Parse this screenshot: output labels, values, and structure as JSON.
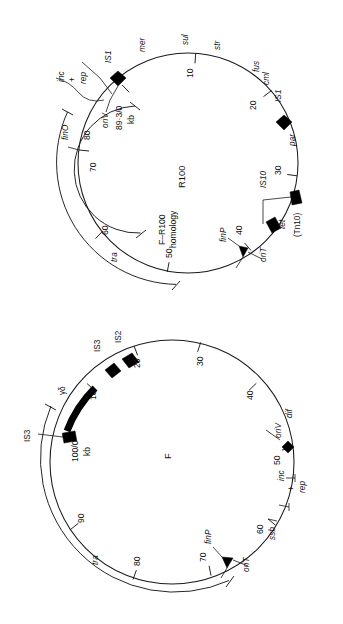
{
  "figure": {
    "background": "#ffffff",
    "ink": "#1a1a1a"
  },
  "maps": [
    {
      "id": "r100",
      "center_label": "R100",
      "origin_label": "89·3/0",
      "unit_label": "kb",
      "inner_arc_label_1": "F–R100",
      "inner_arc_label_2": "homology",
      "tra_label": "tra",
      "scale_ticks": [
        "10",
        "20",
        "30",
        "40",
        "50",
        "60",
        "70",
        "80"
      ],
      "genes": [
        {
          "name": "IS1",
          "type": "element"
        },
        {
          "name": "mer",
          "type": "gene"
        },
        {
          "name": "sul",
          "type": "gene"
        },
        {
          "name": "str",
          "type": "gene"
        },
        {
          "name": "fus",
          "type": "gene"
        },
        {
          "name": "cml",
          "type": "gene"
        },
        {
          "name": "IS1",
          "type": "element"
        },
        {
          "name": "par",
          "type": "gene"
        },
        {
          "name": "IS10",
          "type": "element"
        },
        {
          "name": "tet",
          "type": "gene"
        },
        {
          "name": "(Tn10)",
          "type": "transposon"
        },
        {
          "name": "oriT",
          "type": "site"
        },
        {
          "name": "finP",
          "type": "gene"
        },
        {
          "name": "tra",
          "type": "region"
        },
        {
          "name": "finO",
          "type": "gene"
        },
        {
          "name": "oriV",
          "type": "site"
        },
        {
          "name": "inc",
          "type": "region"
        },
        {
          "name": "rep",
          "type": "region"
        },
        {
          "name": "+",
          "type": "symbol"
        }
      ]
    },
    {
      "id": "f",
      "center_label": "F",
      "origin_label": "100/0",
      "unit_label": "kb",
      "tra_label": "tra",
      "scale_ticks": [
        "10",
        "20",
        "30",
        "40",
        "50",
        "60",
        "70",
        "80",
        "90"
      ],
      "genes": [
        {
          "name": "IS3",
          "type": "element"
        },
        {
          "name": "IS2",
          "type": "element"
        },
        {
          "name": "γδ",
          "type": "transposon"
        },
        {
          "name": "IS3",
          "type": "element"
        },
        {
          "name": "dif",
          "type": "site"
        },
        {
          "name": "oriV",
          "type": "site"
        },
        {
          "name": "inc",
          "type": "region"
        },
        {
          "name": "rep",
          "type": "region"
        },
        {
          "name": "+",
          "type": "symbol"
        },
        {
          "name": "ssb",
          "type": "gene"
        },
        {
          "name": "finP",
          "type": "gene"
        },
        {
          "name": "oriT",
          "type": "site"
        },
        {
          "name": "tra",
          "type": "region"
        }
      ]
    }
  ],
  "r100_labels": {
    "IS1_top": "IS1",
    "mer": "mer",
    "sul": "sul",
    "str": "str",
    "fus": "fus",
    "cml": "cml",
    "IS1_right": "IS1",
    "par": "par",
    "IS10": "IS10",
    "tet": "tet",
    "Tn10": "(Tn10)",
    "oriT": "oriT",
    "finP": "finP",
    "tra": "tra",
    "finO": "finO",
    "oriV": "oriV",
    "inc": "inc",
    "rep": "rep",
    "plus": "+",
    "origin": "89·3/0",
    "kb": "kb",
    "center": "R100",
    "homology1": "F–R100",
    "homology2": "homology",
    "t10": "10",
    "t20": "20",
    "t30": "30",
    "t40": "40",
    "t50": "50",
    "t60": "60",
    "t70": "70",
    "t80": "80"
  },
  "f_labels": {
    "IS3_top": "IS3",
    "IS2": "IS2",
    "gd": "γδ",
    "IS3_left": "IS3",
    "dif": "dif",
    "oriV": "oriV",
    "inc": "inc",
    "rep": "rep",
    "plus": "+",
    "ssb": "ssb",
    "finP": "finP",
    "oriT": "oriT",
    "tra": "tra",
    "origin": "100/0",
    "kb": "kb",
    "center": "F",
    "t10": "10",
    "t20": "20",
    "t30": "30",
    "t40": "40",
    "t50": "50",
    "t60": "60",
    "t70": "70",
    "t80": "80",
    "t90": "90"
  }
}
